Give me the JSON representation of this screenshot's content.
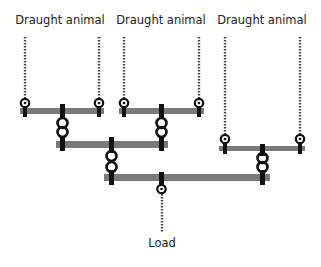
{
  "diagram": {
    "animal_labels": [
      "Draught animal",
      "Draught animal",
      "Draught animal"
    ],
    "load_label": "Load",
    "colors": {
      "bar": "#7a7a7a",
      "rope": "#444444",
      "hardware": "#111111",
      "text": "#222222"
    }
  }
}
